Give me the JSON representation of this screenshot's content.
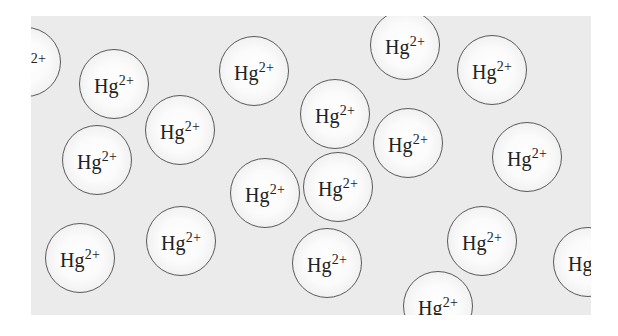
{
  "diagram": {
    "title": "",
    "background_color": "#ebebeb",
    "circle_border_color": "#5a5a5a",
    "ion_symbol": "Hg",
    "ion_charge": "2+",
    "ions": [
      {
        "id": 1,
        "x": -5,
        "y": 46,
        "symbol": "Hg",
        "charge": "2+",
        "partial": "left"
      },
      {
        "id": 2,
        "x": 83,
        "y": 68,
        "symbol": "Hg",
        "charge": "2+"
      },
      {
        "id": 3,
        "x": 149,
        "y": 114,
        "symbol": "Hg",
        "charge": "2+"
      },
      {
        "id": 4,
        "x": 66,
        "y": 144,
        "symbol": "Hg",
        "charge": "2+"
      },
      {
        "id": 5,
        "x": 223,
        "y": 55,
        "symbol": "Hg",
        "charge": "2+"
      },
      {
        "id": 6,
        "x": 304,
        "y": 98,
        "symbol": "Hg",
        "charge": "2+"
      },
      {
        "id": 7,
        "x": 374,
        "y": 29,
        "symbol": "Hg",
        "charge": "2+"
      },
      {
        "id": 8,
        "x": 461,
        "y": 54,
        "symbol": "Hg",
        "charge": "2+"
      },
      {
        "id": 9,
        "x": 377,
        "y": 127,
        "symbol": "Hg",
        "charge": "2+"
      },
      {
        "id": 10,
        "x": 496,
        "y": 141,
        "symbol": "Hg",
        "charge": "2+"
      },
      {
        "id": 11,
        "x": 234,
        "y": 177,
        "symbol": "Hg",
        "charge": "2+"
      },
      {
        "id": 12,
        "x": 307,
        "y": 171,
        "symbol": "Hg",
        "charge": "2+"
      },
      {
        "id": 13,
        "x": 49,
        "y": 242,
        "symbol": "Hg",
        "charge": "2+"
      },
      {
        "id": 14,
        "x": 150,
        "y": 225,
        "symbol": "Hg",
        "charge": "2+"
      },
      {
        "id": 15,
        "x": 296,
        "y": 247,
        "symbol": "Hg",
        "charge": "2+"
      },
      {
        "id": 16,
        "x": 451,
        "y": 225,
        "symbol": "Hg",
        "charge": "2+"
      },
      {
        "id": 17,
        "x": 407,
        "y": 290,
        "symbol": "Hg",
        "charge": "2+",
        "partial": "bottom"
      },
      {
        "id": 18,
        "x": 557,
        "y": 246,
        "symbol": "Hg",
        "charge": "2+",
        "partial": "right"
      }
    ]
  }
}
